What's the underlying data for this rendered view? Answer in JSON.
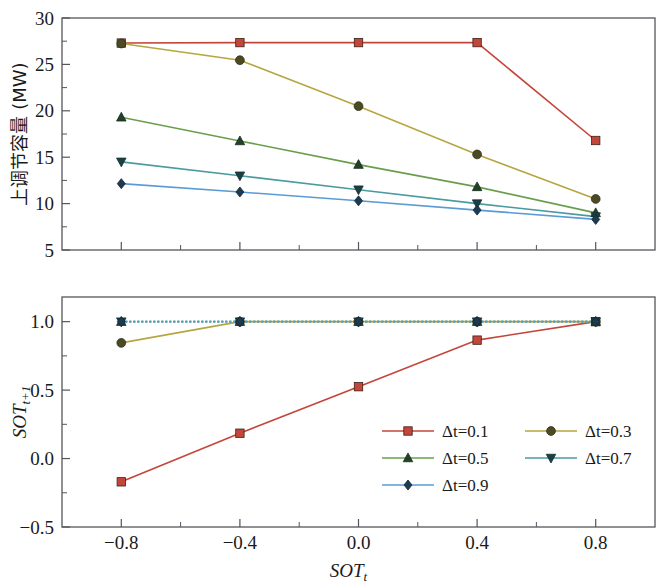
{
  "figure": {
    "background": "#ffffff",
    "axis_color": "#55555c"
  },
  "chart_data": [
    {
      "id": "upper",
      "type": "line",
      "title": "",
      "xlabel": "",
      "ylabel": "上调节容量 (MW)",
      "x": [
        -0.8,
        -0.4,
        0.0,
        0.4,
        0.8
      ],
      "xlim": [
        -1.0,
        1.0
      ],
      "ylim": [
        5,
        30
      ],
      "xticks": [
        -0.8,
        -0.4,
        0.0,
        0.4,
        0.8
      ],
      "xticklabels": [
        "",
        "",
        "",
        "",
        ""
      ],
      "yticks": [
        5,
        10,
        15,
        20,
        25,
        30
      ],
      "yticklabels": [
        "5",
        "10",
        "15",
        "20",
        "25",
        "30"
      ],
      "yminor": [
        7.5,
        12.5,
        17.5,
        22.5,
        27.5
      ],
      "grid": false,
      "series": [
        {
          "name": "Δt=0.1",
          "color": "#c4453a",
          "marker": "square",
          "values": [
            27.3,
            27.35,
            27.35,
            27.35,
            16.8
          ]
        },
        {
          "name": "Δt=0.3",
          "color": "#b5a642",
          "marker": "circle",
          "values": [
            27.25,
            25.45,
            20.5,
            15.3,
            10.5
          ]
        },
        {
          "name": "Δt=0.5",
          "color": "#6a9e4f",
          "marker": "triangle-up",
          "values": [
            19.3,
            16.75,
            14.2,
            11.8,
            9.0
          ]
        },
        {
          "name": "Δt=0.7",
          "color": "#4a9ba0",
          "marker": "triangle-down",
          "values": [
            14.5,
            13.0,
            11.5,
            10.0,
            8.6
          ]
        },
        {
          "name": "Δt=0.9",
          "color": "#5b9bd5",
          "marker": "diamond",
          "values": [
            12.15,
            11.25,
            10.3,
            9.3,
            8.3
          ]
        }
      ]
    },
    {
      "id": "lower",
      "type": "line",
      "title": "",
      "xlabel": "SOT",
      "xlabel_sub": "t",
      "ylabel": "SOT",
      "ylabel_sub": "t+1",
      "x": [
        -0.8,
        -0.4,
        0.0,
        0.4,
        0.8
      ],
      "xlim": [
        -1.0,
        1.0
      ],
      "ylim": [
        -0.5,
        1.18
      ],
      "xticks": [
        -0.8,
        -0.4,
        0.0,
        0.4,
        0.8
      ],
      "xticklabels": [
        "−0.8",
        "−0.4",
        "0.0",
        "0.4",
        "0.8"
      ],
      "yticks": [
        -0.5,
        0.0,
        0.5,
        1.0
      ],
      "yticklabels": [
        "−0.5",
        "0.0",
        "0.5",
        "1.0"
      ],
      "yminor": [
        -0.25,
        0.25,
        0.75
      ],
      "grid": false,
      "series": [
        {
          "name": "Δt=0.1",
          "color": "#c4453a",
          "marker": "square",
          "values": [
            -0.17,
            0.185,
            0.525,
            0.865,
            1.0
          ]
        },
        {
          "name": "Δt=0.3",
          "color": "#b5a642",
          "marker": "circle",
          "values": [
            0.845,
            1.0,
            1.0,
            1.0,
            1.0
          ]
        },
        {
          "name": "Δt=0.5",
          "color": "#6a9e4f",
          "marker": "triangle-up",
          "values": [
            1.0,
            1.0,
            1.0,
            1.0,
            1.0
          ]
        },
        {
          "name": "Δt=0.7",
          "color": "#4a9ba0",
          "marker": "triangle-down",
          "values": [
            1.0,
            1.0,
            1.0,
            1.0,
            1.0
          ]
        },
        {
          "name": "Δt=0.9",
          "color": "#5b9bd5",
          "marker": "diamond",
          "values": [
            1.0,
            1.0,
            1.0,
            1.0,
            1.0
          ]
        }
      ]
    }
  ],
  "legend": {
    "position": "lower-right-inside",
    "entries": [
      {
        "label": "Δt=0.1",
        "color": "#c4453a",
        "marker": "square"
      },
      {
        "label": "Δt=0.3",
        "color": "#b5a642",
        "marker": "circle"
      },
      {
        "label": "Δt=0.5",
        "color": "#6a9e4f",
        "marker": "triangle-up"
      },
      {
        "label": "Δt=0.7",
        "color": "#4a9ba0",
        "marker": "triangle-down"
      },
      {
        "label": "Δt=0.9",
        "color": "#5b9bd5",
        "marker": "diamond"
      }
    ]
  }
}
